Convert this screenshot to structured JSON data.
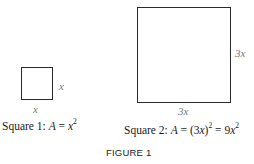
{
  "figure": {
    "label": "FIGURE 1",
    "square1": {
      "side_right_label": "x",
      "side_bottom_label": "x",
      "caption_prefix": "Square 1:  ",
      "caption_A": "A",
      "caption_eq": " = ",
      "caption_base": "x",
      "caption_exp": "2"
    },
    "square2": {
      "side_right_label": "3x",
      "side_bottom_label": "3x",
      "caption_prefix": "Square 2:  ",
      "caption_A": "A",
      "caption_eq1": " = (3",
      "caption_x1": "x",
      "caption_close": ")",
      "caption_exp1": "2",
      "caption_eq2": " = 9",
      "caption_x2": "x",
      "caption_exp2": "2"
    }
  }
}
